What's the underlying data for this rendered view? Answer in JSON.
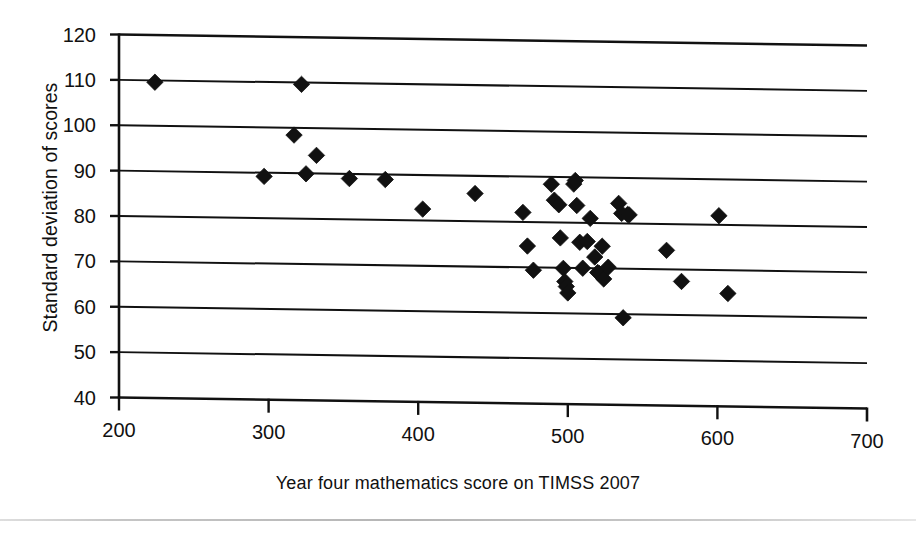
{
  "chart_data": {
    "type": "scatter",
    "title": "",
    "xlabel": "Year four mathematics score on TIMSS 2007",
    "ylabel": "Standard deviation of scores",
    "xlim": [
      200,
      700
    ],
    "ylim": [
      40,
      120
    ],
    "xticks": [
      200,
      300,
      400,
      500,
      600,
      700
    ],
    "yticks": [
      40,
      50,
      60,
      70,
      80,
      90,
      100,
      110,
      120
    ],
    "grid": "horizontal",
    "legend": "none",
    "marker": "filled-diamond",
    "marker_color": "#111111",
    "n_points": 43,
    "points": [
      [
        224,
        109.6
      ],
      [
        297,
        89.2
      ],
      [
        322,
        109.6
      ],
      [
        317,
        98.4
      ],
      [
        325,
        89.9
      ],
      [
        332,
        94.0
      ],
      [
        354,
        89.0
      ],
      [
        378,
        88.9
      ],
      [
        403,
        82.5
      ],
      [
        438,
        86.1
      ],
      [
        470,
        82.1
      ],
      [
        473,
        74.7
      ],
      [
        477,
        69.4
      ],
      [
        489,
        88.4
      ],
      [
        491,
        84.9
      ],
      [
        494,
        83.9
      ],
      [
        495,
        76.6
      ],
      [
        497,
        69.9
      ],
      [
        498,
        67.0
      ],
      [
        499,
        65.9
      ],
      [
        500,
        64.5
      ],
      [
        504,
        88.5
      ],
      [
        505,
        89.3
      ],
      [
        506,
        83.8
      ],
      [
        508,
        75.7
      ],
      [
        510,
        70.0
      ],
      [
        513,
        75.9
      ],
      [
        515,
        81.0
      ],
      [
        518,
        72.5
      ],
      [
        520,
        69.1
      ],
      [
        521,
        68.9
      ],
      [
        523,
        74.9
      ],
      [
        524,
        67.7
      ],
      [
        527,
        70.3
      ],
      [
        534,
        84.4
      ],
      [
        536,
        82.2
      ],
      [
        537,
        59.2
      ],
      [
        540,
        82.0
      ],
      [
        541,
        81.9
      ],
      [
        566,
        74.2
      ],
      [
        576,
        67.4
      ],
      [
        601,
        82.0
      ],
      [
        607,
        64.9
      ]
    ]
  },
  "axes": {
    "x_tick_labels": [
      "200",
      "300",
      "400",
      "500",
      "600",
      "700"
    ],
    "y_tick_labels": [
      "120",
      "110",
      "100",
      "90",
      "80",
      "70",
      "60",
      "50",
      "40"
    ]
  }
}
